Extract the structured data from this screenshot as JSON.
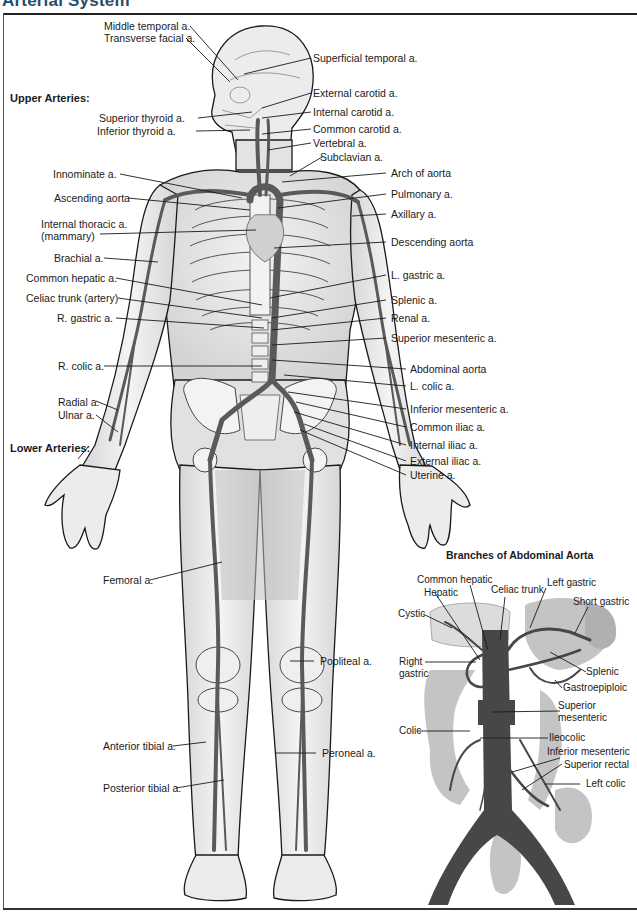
{
  "title": "Arterial System",
  "sections": {
    "upper": "Upper Arteries:",
    "lower": "Lower Arteries:"
  },
  "labels_left": [
    {
      "id": "middle-temporal",
      "text": "Middle temporal a."
    },
    {
      "id": "transverse-facial",
      "text": "Transverse facial a."
    },
    {
      "id": "superior-thyroid",
      "text": "Superior thyroid a."
    },
    {
      "id": "inferior-thyroid",
      "text": "Inferior thyroid a."
    },
    {
      "id": "innominate",
      "text": "Innominate a."
    },
    {
      "id": "ascending-aorta",
      "text": "Ascending aorta"
    },
    {
      "id": "internal-thoracic",
      "text": "Internal thoracic a."
    },
    {
      "id": "internal-thoracic-2",
      "text": "(mammary)"
    },
    {
      "id": "brachial",
      "text": "Brachial a."
    },
    {
      "id": "common-hepatic",
      "text": "Common hepatic a."
    },
    {
      "id": "celiac-trunk",
      "text": "Celiac trunk (artery)"
    },
    {
      "id": "r-gastric",
      "text": "R. gastric a."
    },
    {
      "id": "r-colic",
      "text": "R. colic a."
    },
    {
      "id": "radial",
      "text": "Radial a."
    },
    {
      "id": "ulnar",
      "text": "Ulnar a."
    },
    {
      "id": "femoral",
      "text": "Femoral a."
    },
    {
      "id": "anterior-tibial",
      "text": "Anterior tibial a."
    },
    {
      "id": "posterior-tibial",
      "text": "Posterior tibial a."
    }
  ],
  "labels_right": [
    {
      "id": "superficial-temporal",
      "text": "Superficial temporal a."
    },
    {
      "id": "external-carotid",
      "text": "External carotid a."
    },
    {
      "id": "internal-carotid",
      "text": "Internal carotid a."
    },
    {
      "id": "common-carotid",
      "text": "Common carotid a."
    },
    {
      "id": "vertebral",
      "text": "Vertebral a."
    },
    {
      "id": "subclavian",
      "text": "Subclavian a."
    },
    {
      "id": "arch-of-aorta",
      "text": "Arch of aorta"
    },
    {
      "id": "pulmonary",
      "text": "Pulmonary a."
    },
    {
      "id": "axillary",
      "text": "Axillary a."
    },
    {
      "id": "descending-aorta",
      "text": "Descending aorta"
    },
    {
      "id": "l-gastric",
      "text": "L. gastric a."
    },
    {
      "id": "splenic",
      "text": "Splenic a."
    },
    {
      "id": "renal",
      "text": "Renal a."
    },
    {
      "id": "superior-mesenteric",
      "text": "Superior mesenteric a."
    },
    {
      "id": "abdominal-aorta",
      "text": "Abdominal aorta"
    },
    {
      "id": "l-colic",
      "text": "L. colic a."
    },
    {
      "id": "inferior-mesenteric",
      "text": "Inferior mesenteric a."
    },
    {
      "id": "common-iliac",
      "text": "Common iliac a."
    },
    {
      "id": "internal-iliac",
      "text": "Internal iliac a."
    },
    {
      "id": "external-iliac",
      "text": "External iliac a."
    },
    {
      "id": "uterine",
      "text": "Uterine a."
    },
    {
      "id": "popliteal",
      "text": "Popliteal a."
    },
    {
      "id": "peroneal",
      "text": "Peroneal a."
    }
  ],
  "inset": {
    "title": "Branches of Abdominal Aorta",
    "labels": [
      {
        "id": "common-hepatic",
        "text": "Common hepatic"
      },
      {
        "id": "hepatic",
        "text": "Hepatic"
      },
      {
        "id": "celiac-trunk",
        "text": "Celiac trunk"
      },
      {
        "id": "left-gastric",
        "text": "Left gastric"
      },
      {
        "id": "short-gastric",
        "text": "Short gastric"
      },
      {
        "id": "cystic",
        "text": "Cystic"
      },
      {
        "id": "right-gastric-1",
        "text": "Right"
      },
      {
        "id": "right-gastric-2",
        "text": "gastric"
      },
      {
        "id": "splenic",
        "text": "Splenic"
      },
      {
        "id": "gastroepiploic",
        "text": "Gastroepiploic"
      },
      {
        "id": "superior-mesenteric-1",
        "text": "Superior"
      },
      {
        "id": "superior-mesenteric-2",
        "text": "mesenteric"
      },
      {
        "id": "colic",
        "text": "Colic"
      },
      {
        "id": "ileocolic",
        "text": "Ileocolic"
      },
      {
        "id": "inferior-mesenteric",
        "text": "Inferior mesenteric"
      },
      {
        "id": "superior-rectal",
        "text": "Superior rectal"
      },
      {
        "id": "left-colic",
        "text": "Left colic"
      }
    ]
  },
  "colors": {
    "title": "#1f4f6e",
    "vessel": "#5a5a5a",
    "body_fill": "#e9e9e9",
    "outline": "#1a1a1a",
    "inset_organ": "#bdbdbd",
    "inset_vessel": "#4a4a4a"
  }
}
